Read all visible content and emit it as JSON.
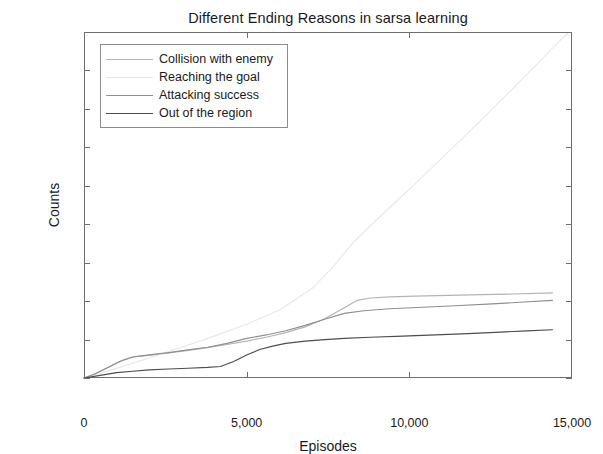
{
  "figure": {
    "title": "Different Ending Reasons in sarsa learning",
    "caption": ""
  },
  "axes": {
    "xlabel": "Episodes",
    "ylabel": "Counts",
    "xticks": [
      "0",
      "5,000",
      "10,000",
      "15,000"
    ],
    "xtick_values": [
      0,
      5000,
      10000,
      15000
    ],
    "yticks": [
      "0",
      "1,000",
      "2,000",
      "3,000",
      "4,000",
      "5,000",
      "6,000",
      "7,000",
      "8,000",
      "9,000"
    ],
    "ytick_values": [
      0,
      1000,
      2000,
      3000,
      4000,
      5000,
      6000,
      7000,
      8000,
      9000
    ]
  },
  "legend": {
    "items": [
      {
        "label": "Collision with enemy",
        "color": "#b4b4b4"
      },
      {
        "label": "Reaching the goal",
        "color": "#e8e8e8"
      },
      {
        "label": "Attacking success",
        "color": "#8f8f8f"
      },
      {
        "label": "Out of the region",
        "color": "#4d4d4d"
      }
    ]
  },
  "chart_data": {
    "type": "line",
    "title": "Different Ending Reasons in sarsa learning",
    "xlabel": "Episodes",
    "ylabel": "Counts",
    "xlim": [
      0,
      15000
    ],
    "ylim": [
      0,
      9000
    ],
    "grid": false,
    "legend_position": "upper-left",
    "series": [
      {
        "name": "Collision with enemy",
        "color": "#b4b4b4",
        "points": [
          [
            0,
            0
          ],
          [
            400,
            130
          ],
          [
            800,
            300
          ],
          [
            1200,
            470
          ],
          [
            1500,
            550
          ],
          [
            2000,
            590
          ],
          [
            2600,
            650
          ],
          [
            3200,
            720
          ],
          [
            3800,
            790
          ],
          [
            4400,
            870
          ],
          [
            5000,
            960
          ],
          [
            5600,
            1060
          ],
          [
            6200,
            1180
          ],
          [
            6800,
            1330
          ],
          [
            7400,
            1540
          ],
          [
            8000,
            1830
          ],
          [
            8400,
            2020
          ],
          [
            8800,
            2080
          ],
          [
            9400,
            2110
          ],
          [
            10200,
            2130
          ],
          [
            11200,
            2150
          ],
          [
            12200,
            2170
          ],
          [
            13200,
            2185
          ],
          [
            14400,
            2215
          ]
        ]
      },
      {
        "name": "Reaching the goal",
        "color": "#e8e8e8",
        "points": [
          [
            0,
            0
          ],
          [
            1000,
            250
          ],
          [
            2000,
            520
          ],
          [
            3000,
            800
          ],
          [
            4000,
            1090
          ],
          [
            5000,
            1400
          ],
          [
            6000,
            1760
          ],
          [
            7000,
            2320
          ],
          [
            7600,
            2840
          ],
          [
            8300,
            3550
          ],
          [
            9200,
            4280
          ],
          [
            10200,
            5070
          ],
          [
            11200,
            5880
          ],
          [
            12200,
            6700
          ],
          [
            13200,
            7540
          ],
          [
            14000,
            8230
          ],
          [
            14400,
            8580
          ],
          [
            14900,
            9000
          ]
        ]
      },
      {
        "name": "Attacking success",
        "color": "#8f8f8f",
        "points": [
          [
            0,
            0
          ],
          [
            300,
            90
          ],
          [
            700,
            260
          ],
          [
            1100,
            430
          ],
          [
            1500,
            545
          ],
          [
            2000,
            600
          ],
          [
            2600,
            660
          ],
          [
            3200,
            730
          ],
          [
            3800,
            800
          ],
          [
            4400,
            900
          ],
          [
            5000,
            1030
          ],
          [
            5600,
            1120
          ],
          [
            6200,
            1230
          ],
          [
            6800,
            1370
          ],
          [
            7400,
            1530
          ],
          [
            8000,
            1680
          ],
          [
            8600,
            1750
          ],
          [
            9400,
            1800
          ],
          [
            10400,
            1840
          ],
          [
            11400,
            1880
          ],
          [
            12400,
            1920
          ],
          [
            13400,
            1970
          ],
          [
            14400,
            2020
          ]
        ]
      },
      {
        "name": "Out of the region",
        "color": "#4d4d4d",
        "points": [
          [
            0,
            0
          ],
          [
            500,
            70
          ],
          [
            1000,
            140
          ],
          [
            1500,
            175
          ],
          [
            2000,
            210
          ],
          [
            2600,
            235
          ],
          [
            3200,
            255
          ],
          [
            3800,
            275
          ],
          [
            4200,
            300
          ],
          [
            4600,
            430
          ],
          [
            5000,
            600
          ],
          [
            5400,
            740
          ],
          [
            5800,
            830
          ],
          [
            6200,
            900
          ],
          [
            6800,
            960
          ],
          [
            7400,
            1000
          ],
          [
            8000,
            1030
          ],
          [
            8800,
            1060
          ],
          [
            9800,
            1090
          ],
          [
            10800,
            1120
          ],
          [
            11800,
            1155
          ],
          [
            12800,
            1195
          ],
          [
            13600,
            1225
          ],
          [
            14400,
            1255
          ]
        ]
      }
    ]
  }
}
